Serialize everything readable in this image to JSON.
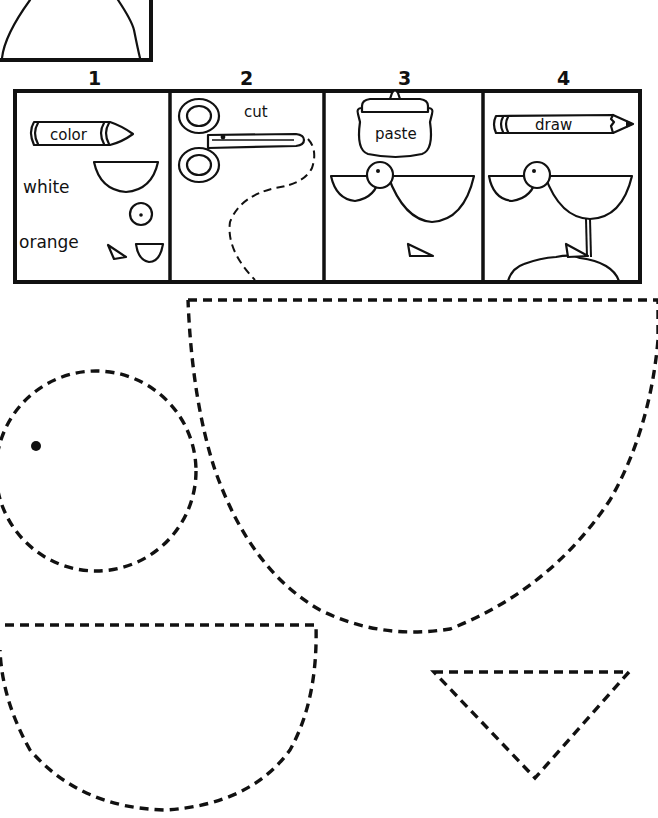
{
  "worksheet": {
    "steps": [
      {
        "number": "1",
        "tool_label": "color",
        "notes": [
          "white",
          "orange"
        ]
      },
      {
        "number": "2",
        "tool_label": "cut"
      },
      {
        "number": "3",
        "tool_label": "paste"
      },
      {
        "number": "4",
        "tool_label": "draw"
      }
    ],
    "cutouts": [
      {
        "shape": "circle-with-eye",
        "color_hint": "white"
      },
      {
        "shape": "large-half-circle-body",
        "color_hint": "white"
      },
      {
        "shape": "small-half-circle-wing",
        "color_hint": "white"
      },
      {
        "shape": "triangle-beak",
        "color_hint": "orange"
      }
    ],
    "colors": {
      "ink": "#111111",
      "paper": "#ffffff"
    }
  }
}
